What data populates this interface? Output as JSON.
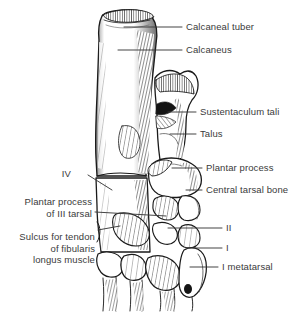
{
  "figure": {
    "kind": "anatomical-line-drawing",
    "background_color": "#ffffff",
    "ink_color": "#1a1a1a",
    "label_color": "#3a3a3a"
  },
  "labels": [
    {
      "id": "calcaneal-tuber",
      "text": "Calcaneal tuber",
      "side": "right",
      "lines": [
        "Calcaneal tuber"
      ]
    },
    {
      "id": "calcaneus",
      "text": "Calcaneus",
      "side": "right",
      "lines": [
        "Calcaneus"
      ]
    },
    {
      "id": "sustentaculum-tali",
      "text": "Sustentaculum tali",
      "side": "right",
      "lines": [
        "Sustentaculum tali"
      ]
    },
    {
      "id": "talus",
      "text": "Talus",
      "side": "right",
      "lines": [
        "Talus"
      ]
    },
    {
      "id": "plantar-process",
      "text": "Plantar process",
      "side": "right",
      "lines": [
        "Plantar process"
      ]
    },
    {
      "id": "central-tarsal-bone",
      "text": "Central tarsal bone",
      "side": "right",
      "lines": [
        "Central tarsal bone"
      ]
    },
    {
      "id": "tarsal-iv",
      "text": "IV",
      "side": "left",
      "lines": [
        "IV"
      ]
    },
    {
      "id": "plantar-process-iii-tarsal",
      "text": "Plantar process of III tarsal",
      "side": "left",
      "lines": [
        "Plantar process",
        "of III tarsal"
      ]
    },
    {
      "id": "sulcus-fibularis-longus",
      "text": "Sulcus for tendon of fibularis longus muscle",
      "side": "left",
      "lines": [
        "Sulcus for tendon",
        "of fibularis",
        "longus muscle"
      ]
    },
    {
      "id": "tarsal-ii",
      "text": "II",
      "side": "right",
      "lines": [
        "II"
      ]
    },
    {
      "id": "tarsal-i",
      "text": "I",
      "side": "right",
      "lines": [
        "I"
      ]
    },
    {
      "id": "metatarsal-i",
      "text": "I metatarsal",
      "side": "right",
      "lines": [
        "I metatarsal"
      ]
    }
  ]
}
